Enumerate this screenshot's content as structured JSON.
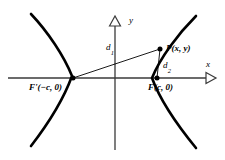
{
  "figure": {
    "type": "hyperbola-focal-definition-diagram",
    "axes": {
      "x_label": "x",
      "y_label": "y",
      "arrowhead_style": "hollow-triangle",
      "origin_px": [
        115,
        78
      ]
    },
    "labels": {
      "left_focus": "F'(−c, 0)",
      "right_focus": "F(c, 0)",
      "point_p": "P(x, y)",
      "distance_1_base": "d",
      "distance_1_sub": "1",
      "distance_2_base": "d",
      "distance_2_sub": "2"
    },
    "points": {
      "left_focus_px": [
        73,
        78
      ],
      "right_focus_px": [
        157,
        78
      ],
      "point_p_px": [
        160,
        49
      ]
    },
    "segments": [
      {
        "name": "d1",
        "from": "F'(−c, 0)",
        "to": "P(x, y)"
      },
      {
        "name": "d2",
        "from": "F(c, 0)",
        "to": "P(x, y)"
      }
    ],
    "curve": {
      "name": "hyperbola",
      "branches": [
        "left-branch-opens-left",
        "right-branch-opens-right"
      ],
      "left_vertex_px": [
        77,
        78
      ],
      "right_vertex_px": [
        152,
        78
      ]
    },
    "colors": {
      "ink": "#000000",
      "axis": "#333333",
      "background": "#ffffff"
    }
  }
}
